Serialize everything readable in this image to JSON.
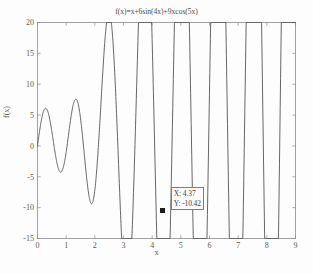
{
  "figure": {
    "title": "f(x)=x+6sin(4x)+9xcos(5x)",
    "xlabel": "x",
    "ylabel": "f(x)",
    "caption": "",
    "background_color": "#fdfdfd",
    "curve_color": "#4a4a4a",
    "axis_color": "#8a8a8a"
  },
  "datatip": {
    "x_line": "X: 4.37",
    "y_line": "Y: -10.42",
    "marker_color": "#1c1c1c"
  },
  "chart_data": {
    "type": "line",
    "title": "f(x)=x+6sin(4x)+9xcos(5x)",
    "xlabel": "x",
    "ylabel": "f(x)",
    "xlim": [
      0,
      9
    ],
    "ylim": [
      -15,
      20
    ],
    "xticks": [
      0,
      1,
      2,
      3,
      4,
      5,
      6,
      7,
      8,
      9
    ],
    "xticklabels": [
      "0",
      "1",
      "2",
      "3",
      "4",
      "5",
      "6",
      "7",
      "8",
      "9"
    ],
    "yticks": [
      -15,
      -10,
      -5,
      0,
      5,
      10,
      15,
      20
    ],
    "yticklabels": [
      "-15",
      "-10",
      "-5",
      "0",
      "5",
      "10",
      "15",
      "20"
    ],
    "grid": false,
    "legend": null,
    "equation": "x + 6*sin(4*x) + 9*x*cos(5*x)",
    "annotations": [
      {
        "type": "datatip",
        "label": "X: 4.37  Y: -10.42",
        "x": 4.37,
        "y": -10.42,
        "marker": "square"
      }
    ],
    "series": [
      {
        "name": "f(x)",
        "color": "#4a4a4a",
        "x": [
          0,
          0.05,
          0.1,
          0.15,
          0.2,
          0.25,
          0.3,
          0.35,
          0.4,
          0.45,
          0.5,
          0.55,
          0.6,
          0.65,
          0.7,
          0.75,
          0.8,
          0.85,
          0.9,
          0.95,
          1,
          1.05,
          1.1,
          1.15,
          1.2,
          1.25,
          1.3,
          1.35,
          1.4,
          1.45,
          1.5,
          1.55,
          1.6,
          1.65,
          1.7,
          1.75,
          1.8,
          1.85,
          1.9,
          1.95,
          2,
          2.05,
          2.1,
          2.15,
          2.2,
          2.25,
          2.3,
          2.35,
          2.4,
          2.45,
          2.5,
          2.55,
          2.6,
          2.65,
          2.7,
          2.75,
          2.8,
          2.85,
          2.9,
          2.95,
          3,
          3.05,
          3.1,
          3.15,
          3.2,
          3.25,
          3.3,
          3.35,
          3.4,
          3.45,
          3.5,
          3.55,
          3.6,
          3.65,
          3.7,
          3.75,
          3.8,
          3.85,
          3.9,
          3.95,
          4,
          4.05,
          4.1,
          4.15,
          4.2,
          4.25,
          4.3,
          4.35,
          4.4,
          4.45,
          4.5,
          4.55,
          4.6,
          4.65,
          4.7,
          4.75,
          4.8,
          4.85,
          4.9,
          4.95,
          5,
          5.05,
          5.1,
          5.15,
          5.2,
          5.25,
          5.3,
          5.35,
          5.4,
          5.45,
          5.5,
          5.55,
          5.6,
          5.65,
          5.7,
          5.75,
          5.8,
          5.85,
          5.9,
          5.95,
          6,
          6.05,
          6.1,
          6.15,
          6.2,
          6.25,
          6.3,
          6.35,
          6.4,
          6.45,
          6.5,
          6.55,
          6.6,
          6.65,
          6.7,
          6.75,
          6.8,
          6.85,
          6.9,
          6.95,
          7,
          7.05,
          7.1,
          7.15,
          7.2,
          7.25,
          7.3,
          7.35,
          7.4,
          7.45,
          7.5,
          7.55,
          7.6,
          7.65,
          7.7,
          7.75,
          7.8,
          7.85,
          7.9,
          7.95,
          8,
          8.05,
          8.1,
          8.15,
          8.2,
          8.25,
          8.3,
          8.35,
          8.4,
          8.45,
          8.5,
          8.55,
          8.6,
          8.65,
          8.7,
          8.75,
          8.8,
          8.85,
          8.9,
          8.95,
          9
        ],
        "note": "y computed from equation at render time"
      }
    ]
  }
}
